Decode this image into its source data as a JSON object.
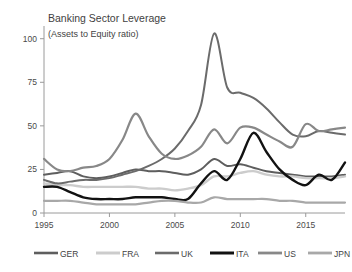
{
  "chart_data": {
    "type": "line",
    "title": "Banking Sector Leverage",
    "subtitle": "(Assets to Equity ratio)",
    "xlabel": "",
    "ylabel": "",
    "xlim": [
      1995,
      2018
    ],
    "ylim": [
      0,
      105
    ],
    "yticks": [
      0,
      25,
      50,
      75,
      100
    ],
    "ytick_labels": [
      "0",
      "25",
      "50",
      "75",
      "100"
    ],
    "xticks": [
      1995,
      2000,
      2005,
      2010,
      2015
    ],
    "xtick_labels": [
      "1995",
      "2000",
      "2005",
      "2010",
      "2015"
    ],
    "grid": false,
    "legend_position": "bottom",
    "x": [
      1995,
      1996,
      1997,
      1998,
      1999,
      2000,
      2001,
      2002,
      2003,
      2004,
      2005,
      2006,
      2007,
      2008,
      2009,
      2010,
      2011,
      2012,
      2013,
      2014,
      2015,
      2016,
      2017,
      2018
    ],
    "series": [
      {
        "name": "GER",
        "color": "#5e5e5e",
        "width": 2.0,
        "values": [
          22,
          23,
          24,
          21,
          20,
          21,
          23,
          25,
          24,
          24,
          23,
          22,
          25,
          31,
          27,
          28,
          26,
          24,
          23,
          22,
          21,
          21,
          21,
          22
        ]
      },
      {
        "name": "FRA",
        "color": "#cccccc",
        "width": 2.4,
        "values": [
          17,
          16,
          16,
          15,
          15,
          15,
          15,
          15,
          14,
          14,
          13,
          14,
          16,
          21,
          21,
          23,
          24,
          22,
          21,
          21,
          20,
          20,
          20,
          21
        ]
      },
      {
        "name": "UK",
        "color": "#6b6b6b",
        "width": 2.0,
        "values": [
          19,
          17,
          18,
          19,
          19,
          20,
          22,
          24,
          27,
          31,
          37,
          47,
          62,
          103,
          72,
          69,
          66,
          60,
          52,
          45,
          44,
          47,
          46,
          45
        ]
      },
      {
        "name": "ITA",
        "color": "#121212",
        "width": 2.4,
        "values": [
          15,
          15,
          12,
          9,
          8,
          8,
          8,
          9,
          9,
          9,
          8,
          8,
          17,
          24,
          19,
          31,
          46,
          35,
          25,
          19,
          16,
          22,
          19,
          29
        ]
      },
      {
        "name": "US",
        "color": "#888888",
        "width": 2.2,
        "values": [
          31,
          25,
          24,
          26,
          27,
          31,
          42,
          57,
          44,
          34,
          31,
          33,
          38,
          48,
          40,
          49,
          49,
          45,
          41,
          38,
          51,
          47,
          48,
          49
        ]
      },
      {
        "name": "JPN",
        "color": "#a8a8a8",
        "width": 2.2,
        "values": [
          7,
          7,
          7,
          6,
          5,
          5,
          5,
          5,
          6,
          7,
          7,
          6,
          6,
          9,
          8,
          8,
          8,
          8,
          7,
          7,
          6,
          6,
          6,
          6
        ]
      }
    ]
  },
  "legend": {
    "items": [
      {
        "label": "GER"
      },
      {
        "label": "FRA"
      },
      {
        "label": "UK"
      },
      {
        "label": "ITA"
      },
      {
        "label": "US"
      },
      {
        "label": "JPN"
      }
    ]
  }
}
